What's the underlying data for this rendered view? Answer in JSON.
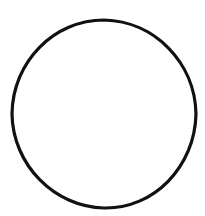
{
  "canvas": {
    "width": 205,
    "height": 216,
    "background_color": "#ffffff"
  },
  "artwork": {
    "title": "circle outline",
    "description": "A single hand-drawn black circle outline on a plain white background",
    "shape_count": 1,
    "fill": "none"
  },
  "shape": {
    "name": "circle",
    "kind": "ellipse",
    "center_x": 104,
    "center_y": 114,
    "radius_x": 92,
    "radius_y": 94,
    "bounds": {
      "left": 12,
      "top": 20,
      "right": 196,
      "bottom": 208,
      "width": 184,
      "height": 188
    },
    "stroke_color": "#111111",
    "stroke_width": 3.2,
    "fill_color": "none"
  },
  "chart_data": {
    "type": "scatter",
    "title": "",
    "xlabel": "",
    "ylabel": "",
    "annotations": []
  }
}
